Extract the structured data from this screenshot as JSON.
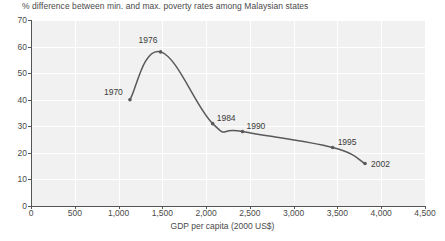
{
  "chart_data": {
    "type": "line",
    "title": "% difference between min. and max. poverty rates among Malaysian states",
    "xlabel": "GDP per capita (2000 US$)",
    "ylabel": "",
    "xlim": [
      0,
      4500
    ],
    "ylim": [
      0,
      70
    ],
    "grid": true,
    "legend": "none",
    "xticks": [
      "0",
      "500",
      "1,000",
      "1,500",
      "2,000",
      "2,500",
      "3,000",
      "3,500",
      "4,000",
      "4,500"
    ],
    "xtick_values": [
      0,
      500,
      1000,
      1500,
      2000,
      2500,
      3000,
      3500,
      4000,
      4500
    ],
    "yticks": [
      "0",
      "10",
      "20",
      "30",
      "40",
      "50",
      "60",
      "70"
    ],
    "ytick_values": [
      0,
      10,
      20,
      30,
      40,
      50,
      60,
      70
    ],
    "series": [
      {
        "name": "% difference between min. and max. poverty rates",
        "points": [
          {
            "label": "1970",
            "x": 1130,
            "y": 40
          },
          {
            "label": "1976",
            "x": 1480,
            "y": 58
          },
          {
            "label": "1984",
            "x": 2075,
            "y": 31
          },
          {
            "label": "1990",
            "x": 2415,
            "y": 28
          },
          {
            "label": "1995",
            "x": 3445,
            "y": 22
          },
          {
            "label": "2002",
            "x": 3815,
            "y": 16
          }
        ],
        "color": "#595959"
      }
    ],
    "annotations": [
      {
        "text": "1970",
        "x": 1130,
        "y": 40
      },
      {
        "text": "1976",
        "x": 1480,
        "y": 58
      },
      {
        "text": "1984",
        "x": 2075,
        "y": 31
      },
      {
        "text": "1990",
        "x": 2415,
        "y": 28
      },
      {
        "text": "1995",
        "x": 3445,
        "y": 22
      },
      {
        "text": "2002",
        "x": 3815,
        "y": 16
      }
    ]
  },
  "chart": {
    "title": "% difference between min. and max. poverty rates among Malaysian states",
    "x_axis_title": "GDP per capita (2000 US$)",
    "source_note": ""
  },
  "ylabels": {
    "t0": "0",
    "t1": "10",
    "t2": "20",
    "t3": "30",
    "t4": "40",
    "t5": "50",
    "t6": "60",
    "t7": "70"
  },
  "xlabels": {
    "t0": "0",
    "t1": "500",
    "t2": "1,000",
    "t3": "1,500",
    "t4": "2,000",
    "t5": "2,500",
    "t6": "3,000",
    "t7": "3,500",
    "t8": "4,000",
    "t9": "4,500"
  },
  "point_labels": {
    "p0": "1970",
    "p1": "1976",
    "p2": "1984",
    "p3": "1990",
    "p4": "1995",
    "p5": "2002"
  },
  "colors": {
    "line": "#595959",
    "plot_background": "#f1f1f1",
    "gridline": "#ffffff",
    "axis": "#555555",
    "text": "#4a4a4a"
  }
}
